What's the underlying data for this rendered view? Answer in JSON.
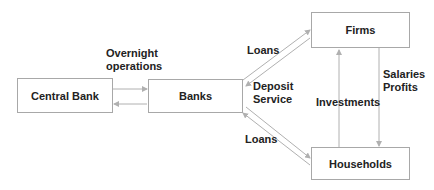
{
  "diagram": {
    "nodes": {
      "central_bank": "Central Bank",
      "banks": "Banks",
      "firms": "Firms",
      "households": "Households"
    },
    "edge_labels": {
      "overnight_line1": "Overnight",
      "overnight_line2": "operations",
      "loans_firms": "Loans",
      "deposit_line1": "Deposit",
      "deposit_line2": "Service",
      "loans_households": "Loans",
      "investments": "Investments",
      "salaries": "Salaries",
      "profits": "Profits"
    },
    "colors": {
      "line": "#b0b0b0",
      "border": "#a8a8a8",
      "text": "#222222"
    }
  }
}
